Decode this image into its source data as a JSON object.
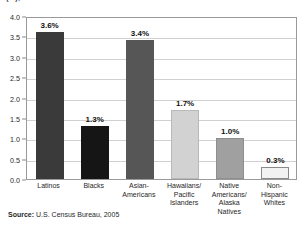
{
  "chart_data": {
    "type": "bar",
    "title": "(%), 2004 to 2005",
    "xlabel": "",
    "ylabel": "",
    "ylim": [
      0,
      4.0
    ],
    "ytick_step": 0.5,
    "grid": true,
    "legend": null,
    "categories": [
      "Latinos",
      "Blacks",
      "Asian-Americans",
      "Hawaiians/ Pacific Islanders",
      "Native Americans/ Alaska Natives",
      "Non-Hispanic Whites"
    ],
    "category_lines": [
      [
        "Latinos"
      ],
      [
        "Blacks"
      ],
      [
        "Asian-",
        "Americans"
      ],
      [
        "Hawaiians/",
        "Pacific",
        "Islanders"
      ],
      [
        "Native",
        "Americans/",
        "Alaska",
        "Natives"
      ],
      [
        "Non-",
        "Hispanic",
        "Whites"
      ]
    ],
    "values": [
      3.6,
      1.3,
      3.4,
      1.7,
      1.0,
      0.3
    ],
    "data_labels": [
      "3.6%",
      "1.3%",
      "3.4%",
      "1.7%",
      "1.0%",
      "0.3%"
    ],
    "bar_colors": [
      "#3a3a3a",
      "#151515",
      "#565656",
      "#d2d2d2",
      "#a0a0a0",
      "#f2f2f2"
    ],
    "bar_border_colors": [
      "#3a3a3a",
      "#151515",
      "#565656",
      "#b9b9b9",
      "#8e8e8e",
      "#8a8a8a"
    ],
    "ytick_labels": [
      "4.0",
      "3.5",
      "3.0",
      "2.5",
      "2.0",
      "1.5",
      "1.0",
      "0.5",
      "0.0"
    ],
    "ytick_values": [
      4.0,
      3.5,
      3.0,
      2.5,
      2.0,
      1.5,
      1.0,
      0.5,
      0.0
    ]
  },
  "source": {
    "label": "Source:",
    "text": "U.S. Census Bureau, 2005"
  }
}
